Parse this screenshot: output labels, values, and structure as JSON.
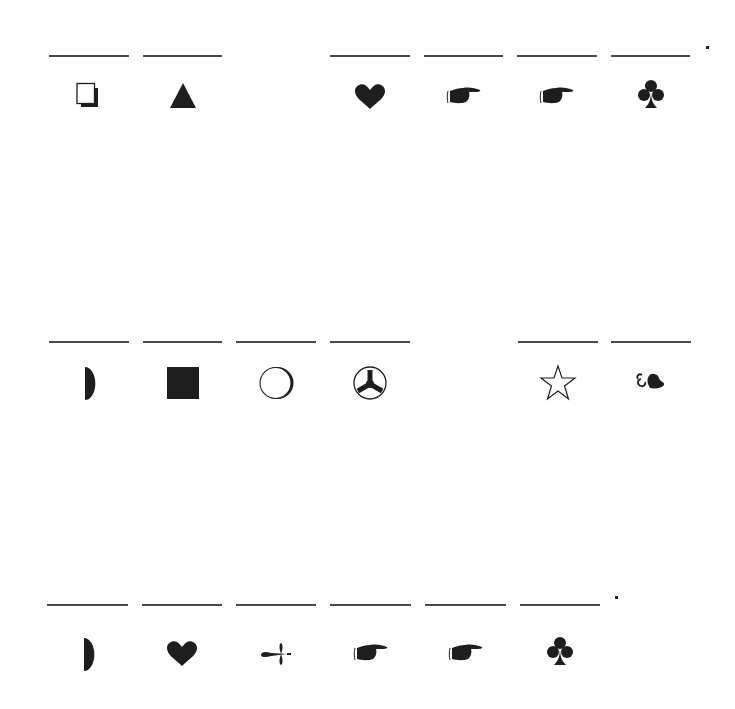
{
  "document": {
    "type": "symbol worksheet (wingdings-style glyphs under fill-in blanks)",
    "ink_color": "#1e1e1e",
    "line_color": "#4a4a4a",
    "background": "#ffffff"
  },
  "rows": [
    {
      "line_y": 55,
      "glyph_y": 97,
      "end_mark": ".",
      "cells": [
        {
          "x": 49,
          "w": 80,
          "glyph": "shadowed-square"
        },
        {
          "x": 143,
          "w": 79,
          "glyph": "triangle"
        },
        {
          "x": 330,
          "w": 80,
          "glyph": "heart"
        },
        {
          "x": 424,
          "w": 79,
          "glyph": "pointing-hand"
        },
        {
          "x": 517,
          "w": 80,
          "glyph": "pointing-hand"
        },
        {
          "x": 611,
          "w": 79,
          "glyph": "club"
        }
      ]
    },
    {
      "line_y": 341,
      "glyph_y": 383,
      "end_mark": "",
      "cells": [
        {
          "x": 49,
          "w": 80,
          "glyph": "half-circle"
        },
        {
          "x": 143,
          "w": 79,
          "glyph": "filled-square"
        },
        {
          "x": 236,
          "w": 80,
          "glyph": "shadowed-circle"
        },
        {
          "x": 330,
          "w": 80,
          "glyph": "radiation-circle"
        },
        {
          "x": 518,
          "w": 80,
          "glyph": "outline-star"
        },
        {
          "x": 611,
          "w": 80,
          "glyph": "floral-heart-bullet"
        }
      ]
    },
    {
      "line_y": 604,
      "glyph_y": 654,
      "end_mark": ".",
      "cells": [
        {
          "x": 47,
          "w": 81,
          "glyph": "half-circle"
        },
        {
          "x": 142,
          "w": 80,
          "glyph": "heart"
        },
        {
          "x": 236,
          "w": 80,
          "glyph": "arrow-flourish"
        },
        {
          "x": 330,
          "w": 81,
          "glyph": "pointing-hand"
        },
        {
          "x": 425,
          "w": 81,
          "glyph": "pointing-hand"
        },
        {
          "x": 520,
          "w": 80,
          "glyph": "club"
        }
      ]
    }
  ],
  "end_marks": [
    {
      "row": 0,
      "x": 706,
      "y": 46
    },
    {
      "row": 2,
      "x": 615,
      "y": 596
    }
  ]
}
